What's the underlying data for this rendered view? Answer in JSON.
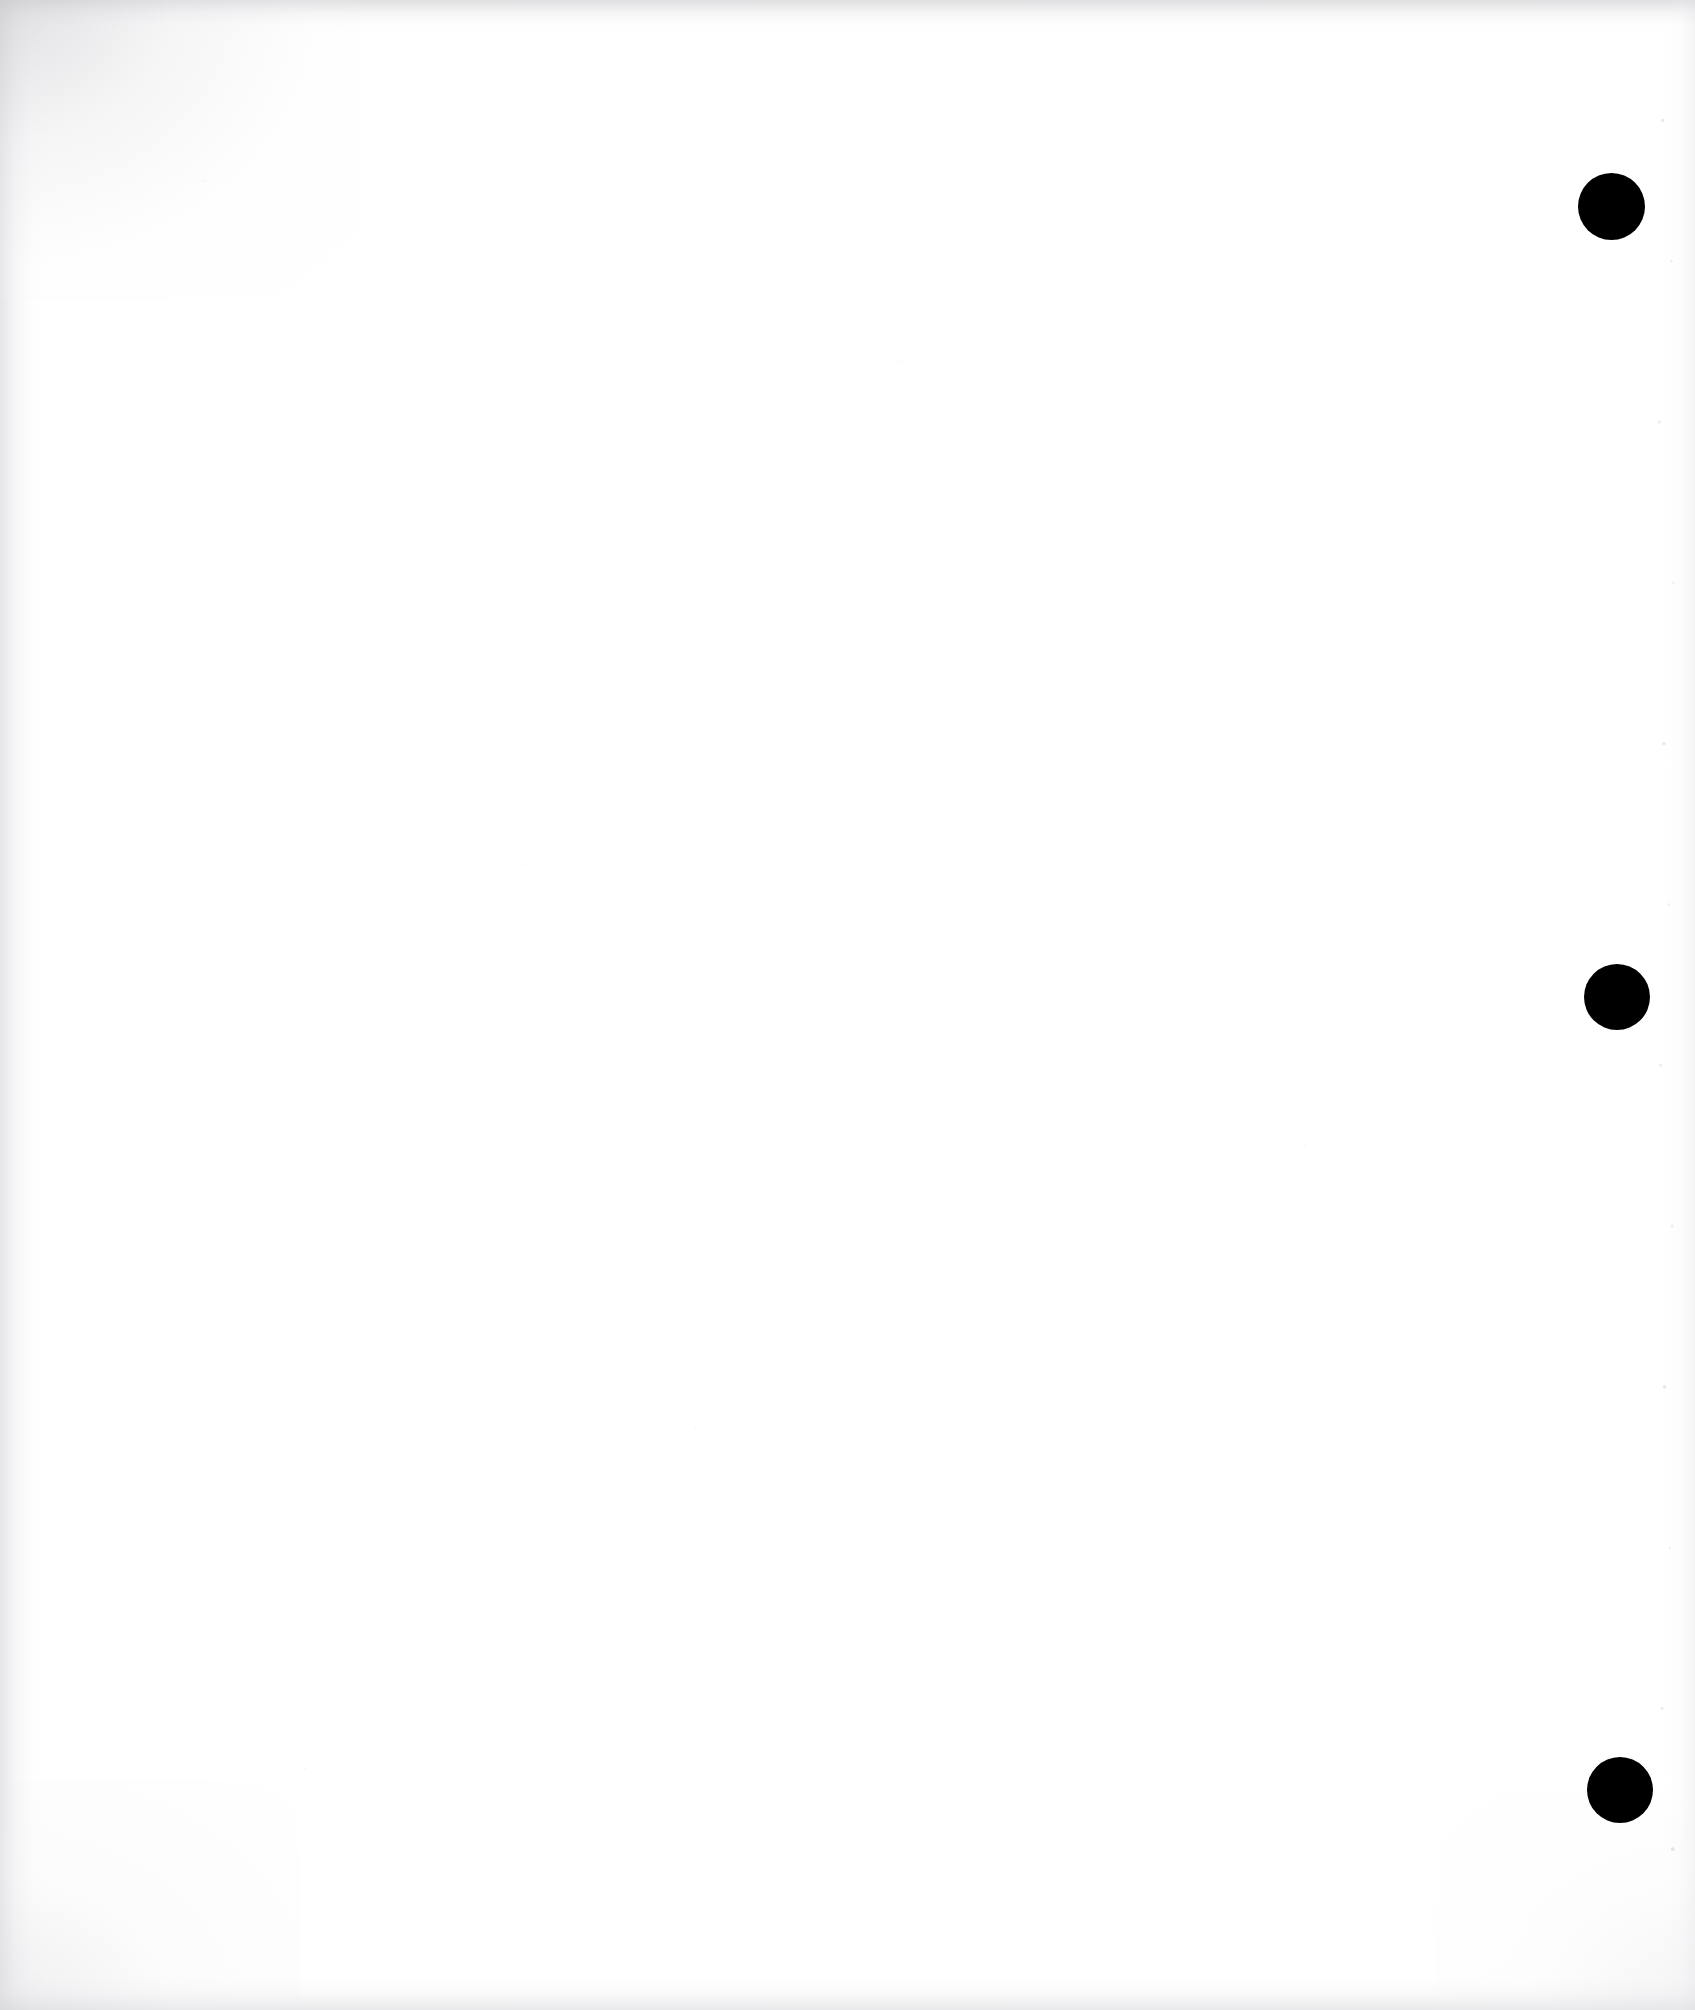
{
  "document": {
    "kind": "scanned-page",
    "page_content": "",
    "page_background_color": "#ffffff",
    "page_width": 1695,
    "page_height": 2010,
    "is_blank": "true"
  },
  "marks": {
    "punch_hole_color": "#000000",
    "holes": [
      {
        "name": "punch-hole-top",
        "cx": 1611,
        "cy": 206,
        "d": 67
      },
      {
        "name": "punch-hole-middle",
        "cx": 1617,
        "cy": 997,
        "d": 66
      },
      {
        "name": "punch-hole-bottom",
        "cx": 1620,
        "cy": 1790,
        "d": 66
      }
    ]
  },
  "scan_artifacts": {
    "edge_shadow_color": "#cdcdd0",
    "vignette_corner": "top-left",
    "speckle_color": "#b0b0b6",
    "grain_color": "#e8e8ec"
  }
}
